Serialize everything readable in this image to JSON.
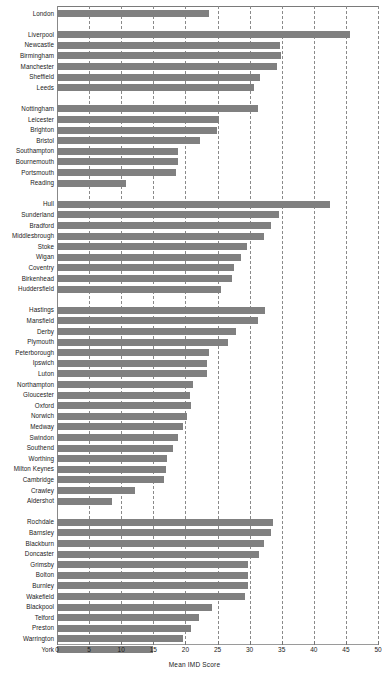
{
  "chart_data": {
    "type": "bar",
    "orientation": "horizontal",
    "title": "",
    "xlabel": "Mean IMD Score",
    "ylabel": "",
    "xlim": [
      0,
      50
    ],
    "xticks": [
      0,
      5,
      10,
      15,
      20,
      25,
      30,
      35,
      40,
      45,
      50
    ],
    "grid": true,
    "grid_axis": "x",
    "grid_style": "dashed",
    "legend": "none",
    "bar_color": "#808080",
    "groups": [
      {
        "name": "group-1",
        "categories": [
          "London"
        ],
        "values": [
          23.7
        ]
      },
      {
        "name": "group-2",
        "categories": [
          "Liverpool",
          "Newcastle",
          "Birmingham",
          "Manchester",
          "Sheffield",
          "Leeds"
        ],
        "values": [
          45.6,
          34.8,
          34.9,
          34.3,
          31.6,
          30.7
        ]
      },
      {
        "name": "group-3",
        "categories": [
          "Nottingham",
          "Leicester",
          "Brighton",
          "Bristol",
          "Southampton",
          "Bournemouth",
          "Portsmouth",
          "Reading"
        ],
        "values": [
          31.3,
          25.3,
          24.9,
          22.3,
          18.9,
          18.8,
          18.6,
          10.7
        ]
      },
      {
        "name": "group-4",
        "categories": [
          "Hull",
          "Sunderland",
          "Bradford",
          "Middlesbrough",
          "Stoke",
          "Wigan",
          "Coventry",
          "Birkenhead",
          "Huddersfield"
        ],
        "values": [
          42.5,
          34.6,
          33.4,
          32.2,
          29.6,
          28.6,
          27.6,
          27.3,
          25.5
        ]
      },
      {
        "name": "group-5",
        "categories": [
          "Hastings",
          "Mansfield",
          "Derby",
          "Plymouth",
          "Peterborough",
          "Ipswich",
          "Luton",
          "Northampton",
          "Gloucester",
          "Oxford",
          "Norwich",
          "Medway",
          "Swindon",
          "Southend",
          "Worthing",
          "Milton Keynes",
          "Cambridge",
          "Crawley",
          "Aldershot"
        ],
        "values": [
          32.4,
          31.3,
          27.9,
          26.6,
          23.7,
          23.4,
          23.4,
          21.2,
          20.7,
          20.8,
          20.2,
          19.6,
          18.9,
          18.1,
          17.2,
          17.0,
          16.6,
          12.2,
          8.6
        ]
      },
      {
        "name": "group-6",
        "categories": [
          "Rochdale",
          "Barnsley",
          "Blackburn",
          "Doncaster",
          "Grimsby",
          "Bolton",
          "Burnley",
          "Wakefield",
          "Blackpool",
          "Telford",
          "Preston",
          "Warrington",
          "York"
        ],
        "values": [
          33.7,
          33.4,
          32.3,
          31.4,
          29.7,
          29.7,
          29.7,
          29.3,
          24.2,
          22.1,
          20.8,
          19.6,
          14.9
        ]
      }
    ]
  },
  "axis": {
    "x_title": "Mean IMD Score",
    "tick_labels": [
      "0",
      "5",
      "10",
      "15",
      "20",
      "25",
      "30",
      "35",
      "40",
      "45",
      "50"
    ]
  }
}
